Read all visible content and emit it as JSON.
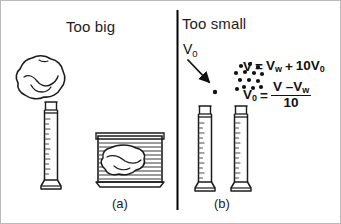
{
  "figure": {
    "left_panel": {
      "title": "Too big",
      "caption": "(a)",
      "objects": {
        "rock": "irregular-rock-outline",
        "cylinder": "graduated-cylinder",
        "beaker": "water-filled-container-with-rock"
      }
    },
    "right_panel": {
      "title": "Too small",
      "caption": "(b)",
      "arrow_label": "V",
      "arrow_label_sub": "0",
      "objects": {
        "single_grain": "single-particle-dot",
        "grain_cluster": "particle-cluster-dots",
        "cylinder_left": "graduated-cylinder",
        "cylinder_right": "graduated-cylinder"
      },
      "equations": [
        {
          "id": "eq-total-volume",
          "lhs": "V",
          "eq": "=",
          "rhs_a": "V",
          "rhs_a_sub": "w",
          "plus": "+",
          "rhs_b": "10V",
          "rhs_b_sub": "0"
        },
        {
          "id": "eq-unit-volume",
          "lhs": "V",
          "lhs_sub": "0",
          "eq": "=",
          "numerator_a": "V",
          "numerator_minus": "–",
          "numerator_b": "V",
          "numerator_b_sub": "w",
          "denominator": "10"
        }
      ]
    },
    "colors": {
      "ink": "#111111",
      "border": "#b9b9b9",
      "divider": "#000000",
      "paper": "#ffffff"
    }
  }
}
